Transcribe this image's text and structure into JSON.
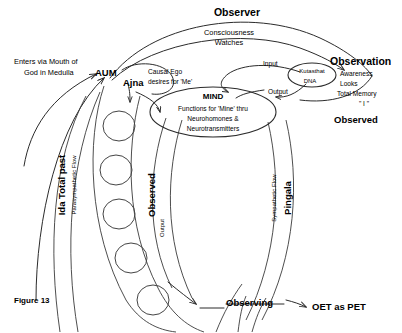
{
  "figure": {
    "caption": "Figure 13",
    "width": 402,
    "height": 333,
    "background": "#ffffff",
    "ink_color": "#2b2b2b"
  },
  "labels": {
    "observer_title": "Observer",
    "consciousness": "Consciousness",
    "watches": "Watches",
    "entry_line1": "Enters via Mouth of",
    "entry_line2": "God in Medulla",
    "aum": "AUM",
    "ajna": "Ajna",
    "causal_ego_line1": "Causal Ego",
    "causal_ego_line2": "desires for 'Me'",
    "mind_title": "MIND",
    "mind_line1": "Functions for 'Mine' thru",
    "mind_line2": "Neurohomones &",
    "mind_line3": "Neurotransmitters",
    "input": "Input",
    "output": "Output",
    "kutastha_line1": "Kutasthat",
    "kutastha_line2": "DNA",
    "observation_title": "Observation",
    "observation_item1": "Awareness",
    "observation_item2": "Looks",
    "observation_item3": "Total Memory",
    "observation_item4": "\" I \"",
    "observed_title": "Observed",
    "ida_total_past": "Ida Total past",
    "parasympathetic_flow": "Parasympathetic Flow",
    "observed_vertical": "Observed",
    "output_vertical": "Output",
    "pingala": "Pingala",
    "sympathetic_flow": "Sympathetic Flow",
    "observing": "Observing",
    "oet_as_pet": "OET  as PET"
  },
  "chakras": {
    "count": 5,
    "name": "chakra-circle"
  }
}
